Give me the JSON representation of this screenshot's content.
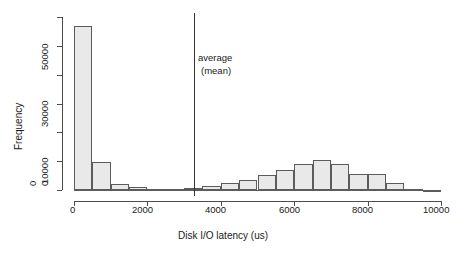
{
  "chart_data": {
    "type": "bar",
    "title": "",
    "xlabel": "Disk I/O latency (us)",
    "ylabel": "Frequency",
    "xlim": [
      0,
      10000
    ],
    "ylim": [
      0,
      60000
    ],
    "grid": false,
    "legend": null,
    "bin_width": 500,
    "xticks": [
      0,
      2000,
      4000,
      6000,
      8000,
      10000
    ],
    "xtick_labels": [
      "0",
      "2000",
      "4000",
      "6000",
      "8000",
      "10000"
    ],
    "yticks": [
      0,
      10000,
      20000,
      30000,
      40000,
      50000,
      60000
    ],
    "ytick_labels": [
      "0",
      "10000",
      "",
      "30000",
      "",
      "50000",
      ""
    ],
    "ytick_labels_shown": [
      "0",
      "10000",
      "30000",
      "50000"
    ],
    "categories": [
      "0-500",
      "500-1000",
      "1000-1500",
      "1500-2000",
      "2000-2500",
      "2500-3000",
      "3000-3500",
      "3500-4000",
      "4000-4500",
      "4500-5000",
      "5000-5500",
      "5500-6000",
      "6000-6500",
      "6500-7000",
      "7000-7500",
      "7500-8000",
      "8000-8500",
      "8500-9000",
      "9000-9500",
      "9500-10000"
    ],
    "bin_starts": [
      0,
      500,
      1000,
      1500,
      2000,
      2500,
      3000,
      3500,
      4000,
      4500,
      5000,
      5500,
      6000,
      6500,
      7000,
      7500,
      8000,
      8500,
      9000,
      9500
    ],
    "values": [
      57000,
      9700,
      2100,
      1000,
      400,
      300,
      700,
      1400,
      2400,
      3600,
      5100,
      7000,
      8900,
      10500,
      9000,
      5400,
      5600,
      2400,
      200,
      100
    ],
    "annotations": [
      {
        "name": "average-mean",
        "line1": "average",
        "line2": "(mean)",
        "x_value": 3270,
        "type": "vline-with-text"
      }
    ],
    "colors": {
      "bar_fill": "#e9e9e9",
      "bar_stroke": "#5c5c5c",
      "axis": "#4d4d4d",
      "mean_line": "#333333",
      "text": "#1a1a1a",
      "background": "#ffffff"
    }
  }
}
